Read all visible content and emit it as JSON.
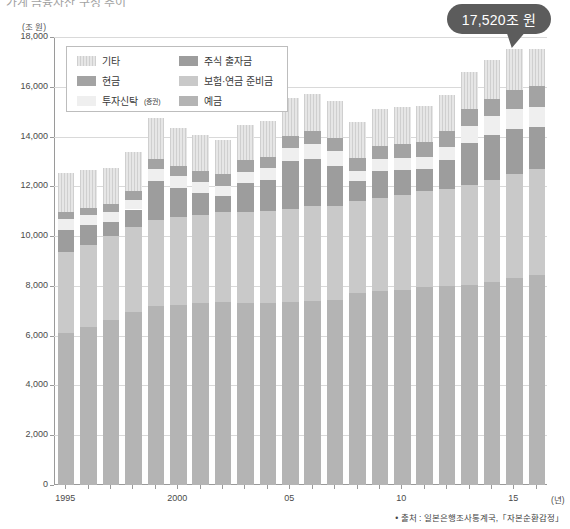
{
  "page_title": "가계 금융자산 구성 추이",
  "axis": {
    "y_unit": "(조 원)",
    "y_ticks": [
      "18,000",
      "16,000",
      "14,000",
      "12,000",
      "10,000",
      "8,000",
      "6,000",
      "4,000",
      "2,000",
      "0"
    ],
    "x_unit": "(년)",
    "x_ticks": [
      "1995",
      "2000",
      "05",
      "10",
      "15"
    ]
  },
  "callout": {
    "label": "17,520조 원"
  },
  "legend": {
    "items": [
      {
        "label": "기타",
        "sub": "",
        "color": "#d7d7d7",
        "key": "etc"
      },
      {
        "label": "주식 출자금",
        "sub": "",
        "color": "#9d9d9d",
        "key": "stock"
      },
      {
        "label": "현금",
        "sub": "",
        "color": "#a3a3a3",
        "key": "cash"
      },
      {
        "label": "보험·연금 준비금",
        "sub": "",
        "color": "#c9c9c9",
        "key": "insure"
      },
      {
        "label": "투자신탁",
        "sub": "(증권)",
        "color": "#efefef",
        "key": "trust"
      },
      {
        "label": "예금",
        "sub": "",
        "color": "#b4b4b4",
        "key": "deposit"
      }
    ]
  },
  "source": {
    "text": "• 출처 : 일본은행조사통계국,「자본순환감정」"
  },
  "chart_data": {
    "type": "bar",
    "stacked": true,
    "title": "가계 금융자산 구성 추이",
    "xlabel": "(년)",
    "ylabel": "(조 원)",
    "ylim": [
      0,
      18000
    ],
    "ytick_step": 2000,
    "grid": true,
    "legend_position": "top-left",
    "categories": [
      "1995",
      "1996",
      "1997",
      "1998",
      "1999",
      "2000",
      "2001",
      "2002",
      "2003",
      "2004",
      "2005",
      "2006",
      "2007",
      "2008",
      "2009",
      "2010",
      "2011",
      "2012",
      "2013",
      "2014",
      "2015",
      "2016"
    ],
    "series": [
      {
        "name": "예금",
        "color": "#b4b4b4",
        "values": [
          6100,
          6350,
          6650,
          6950,
          7200,
          7250,
          7300,
          7350,
          7300,
          7300,
          7350,
          7400,
          7450,
          7700,
          7800,
          7850,
          7950,
          8000,
          8050,
          8150,
          8300,
          8450
        ]
      },
      {
        "name": "보험·연금 준비금",
        "color": "#c9c9c9",
        "values": [
          3250,
          3300,
          3350,
          3400,
          3450,
          3500,
          3550,
          3600,
          3650,
          3700,
          3750,
          3800,
          3750,
          3700,
          3750,
          3800,
          3850,
          3900,
          4000,
          4100,
          4200,
          4250
        ]
      },
      {
        "name": "주식 출자금",
        "color": "#9d9d9d",
        "values": [
          900,
          780,
          560,
          720,
          1550,
          1200,
          900,
          680,
          1200,
          1250,
          1900,
          1900,
          1600,
          800,
          1050,
          1000,
          900,
          1150,
          1700,
          1800,
          1800,
          1700
        ]
      },
      {
        "name": "투자신탁(증권)",
        "color": "#efefef",
        "values": [
          450,
          430,
          420,
          400,
          500,
          480,
          430,
          400,
          430,
          470,
          560,
          620,
          640,
          420,
          480,
          500,
          480,
          540,
          680,
          760,
          800,
          800
        ]
      },
      {
        "name": "현금",
        "color": "#a3a3a3",
        "values": [
          250,
          260,
          320,
          350,
          380,
          400,
          420,
          450,
          460,
          470,
          480,
          490,
          500,
          520,
          550,
          570,
          590,
          620,
          660,
          700,
          760,
          820
        ]
      },
      {
        "name": "기타",
        "color": "#d7d7d7",
        "values": [
          1600,
          1550,
          1450,
          1550,
          1650,
          1520,
          1450,
          1400,
          1420,
          1450,
          1500,
          1520,
          1480,
          1450,
          1480,
          1480,
          1450,
          1480,
          1520,
          1560,
          1660,
          1500
        ]
      }
    ],
    "totals": [
      12550,
      12670,
      12750,
      13370,
      14730,
      14350,
      14050,
      13880,
      14460,
      14640,
      15540,
      15730,
      15420,
      14590,
      15110,
      15200,
      15220,
      15690,
      16610,
      17070,
      17520,
      17520
    ],
    "annotation": {
      "label": "17,520조 원",
      "points_to": "2015"
    }
  }
}
